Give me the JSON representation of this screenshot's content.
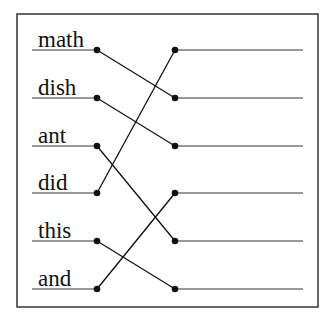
{
  "left_words": [
    "math",
    "dish",
    "ant",
    "did",
    "this",
    "and"
  ],
  "right_slots": 6,
  "connections": [
    {
      "from": 0,
      "to": 1
    },
    {
      "from": 1,
      "to": 2
    },
    {
      "from": 2,
      "to": 4
    },
    {
      "from": 3,
      "to": 0
    },
    {
      "from": 4,
      "to": 5
    },
    {
      "from": 5,
      "to": 3
    }
  ]
}
